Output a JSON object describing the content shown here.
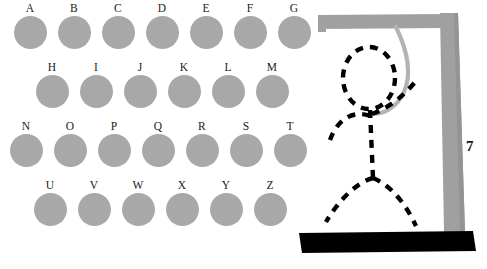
{
  "app": {
    "title": "Hangman"
  },
  "colors": {
    "background": "#ffffff",
    "disc": "#a8a8a8",
    "gallows": "#a0a0a0",
    "gallows_shadow": "#8f8f8f",
    "ground": "#000000",
    "figure": "#000000",
    "rope": "#b5b5b5",
    "label": "#1b1b1b"
  },
  "letter_board": {
    "rows": [
      {
        "name": "row-1",
        "start_x": 12,
        "label_y": 2,
        "spacing": 44,
        "letters": [
          "A",
          "B",
          "C",
          "D",
          "E",
          "F",
          "G"
        ]
      },
      {
        "name": "row-2",
        "start_x": 34,
        "label_y": 61,
        "spacing": 44,
        "letters": [
          "H",
          "I",
          "J",
          "K",
          "L",
          "M"
        ]
      },
      {
        "name": "row-3",
        "start_x": 8,
        "label_y": 120,
        "spacing": 44,
        "letters": [
          "N",
          "O",
          "P",
          "Q",
          "R",
          "S",
          "T"
        ]
      },
      {
        "name": "row-4",
        "start_x": 32,
        "label_y": 179,
        "spacing": 44,
        "letters": [
          "U",
          "V",
          "W",
          "X",
          "Y",
          "Z"
        ]
      }
    ]
  },
  "hangman": {
    "wrong_guess_count": "7",
    "parts_drawn": [
      "head",
      "body",
      "left-arm",
      "right-arm",
      "left-leg",
      "right-leg",
      "rope"
    ],
    "structure": [
      "crossbar",
      "post",
      "ground"
    ]
  }
}
